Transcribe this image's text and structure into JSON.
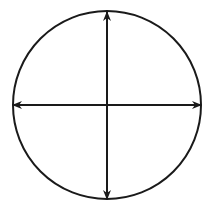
{
  "diagram": {
    "type": "circle-with-crossed-double-arrows",
    "stroke_color": "#1a1a1a",
    "background": "#ffffff",
    "circle": {
      "cx": 107,
      "cy": 105,
      "r": 94,
      "stroke_width": 2
    },
    "arrows": [
      {
        "id": "vertical",
        "x1": 107,
        "y1": 12,
        "x2": 107,
        "y2": 199,
        "heads": "both"
      },
      {
        "id": "horizontal",
        "x1": 13,
        "y1": 105,
        "x2": 201,
        "y2": 105,
        "heads": "both"
      }
    ]
  }
}
